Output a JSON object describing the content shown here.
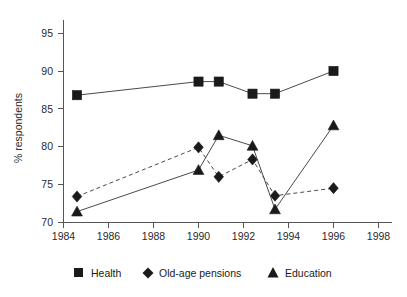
{
  "chart_data": {
    "type": "line",
    "title": "",
    "subtitle": "",
    "xlabel": "",
    "ylabel": "% respondents",
    "xlim": [
      1984,
      1998
    ],
    "ylim": [
      70,
      97
    ],
    "grid": false,
    "legend_position": "bottom",
    "xticks": [
      1984,
      1986,
      1988,
      1990,
      1992,
      1994,
      1996,
      1998
    ],
    "xtick_labels": [
      "1984",
      "1986",
      "1988",
      "1990",
      "1992",
      "1994",
      "1996",
      "1998"
    ],
    "yticks": [
      70,
      75,
      80,
      85,
      90,
      95
    ],
    "ytick_labels": [
      "70",
      "75",
      "80",
      "85",
      "90",
      "95"
    ],
    "series": [
      {
        "name": "Health",
        "marker": "square",
        "linestyle": "solid",
        "color": "#1a1a1a",
        "x": [
          1984.6,
          1990.0,
          1990.9,
          1992.4,
          1993.4,
          1996.0
        ],
        "values": [
          86.8,
          88.6,
          88.6,
          87.0,
          87.0,
          90.0
        ]
      },
      {
        "name": "Old-age pensions",
        "marker": "diamond",
        "linestyle": "dashed",
        "color": "#1a1a1a",
        "x": [
          1984.6,
          1990.0,
          1990.9,
          1992.4,
          1993.4,
          1996.0
        ],
        "values": [
          73.4,
          79.9,
          76.0,
          78.3,
          73.5,
          74.5
        ]
      },
      {
        "name": "Education",
        "marker": "triangle",
        "linestyle": "solid",
        "color": "#1a1a1a",
        "x": [
          1984.6,
          1990.0,
          1990.9,
          1992.4,
          1993.4,
          1996.0
        ],
        "values": [
          71.4,
          76.9,
          81.5,
          80.1,
          71.7,
          82.8
        ]
      }
    ]
  },
  "legend": {
    "items": [
      {
        "label": "Health",
        "marker": "square"
      },
      {
        "label": "Old-age pensions",
        "marker": "diamond"
      },
      {
        "label": "Education",
        "marker": "triangle"
      }
    ]
  }
}
